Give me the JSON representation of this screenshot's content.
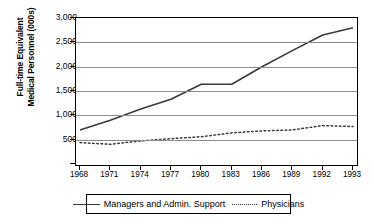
{
  "chart_data": {
    "type": "line",
    "title": "",
    "xlabel": "",
    "ylabel": "Full-time Equivalent Medical Personnel (000s)",
    "ylabel_line1": "Full-time Equivalent",
    "ylabel_line2": "Medical Personnel (000s)",
    "categories": [
      "1968",
      "1971",
      "1974",
      "1977",
      "1980",
      "1983",
      "1986",
      "1989",
      "1992",
      "1993"
    ],
    "ylim": [
      0,
      3000
    ],
    "ytick_values": [
      3000,
      2500,
      2000,
      1500,
      1000,
      500,
      0
    ],
    "ytick_labels": [
      "3,000",
      "2,500",
      "2,000",
      "1,500",
      "1,000",
      "500",
      "-"
    ],
    "grid": "horizontal",
    "legend_position": "bottom",
    "series": [
      {
        "name": "Managers and Admin. Support",
        "style": "solid",
        "color": "#3a3a3a",
        "values": [
          700,
          900,
          1130,
          1330,
          1640,
          1640,
          2000,
          2330,
          2650,
          2800
        ]
      },
      {
        "name": "Physicians",
        "style": "dotted",
        "color": "#3a3a3a",
        "values": [
          440,
          405,
          475,
          520,
          560,
          640,
          680,
          700,
          790,
          770
        ]
      }
    ]
  },
  "legend": {
    "entries": [
      {
        "label": "Managers and Admin. Support",
        "style": "solid"
      },
      {
        "label": "Physicians",
        "style": "dotted"
      }
    ]
  }
}
